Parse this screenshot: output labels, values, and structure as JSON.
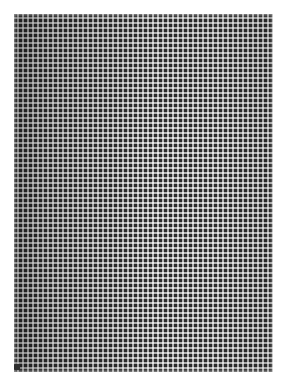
{
  "page": {
    "width": 287,
    "height": 386,
    "background_color": "#ffffff",
    "has_text": false,
    "has_ui_chrome": false
  },
  "pattern": {
    "name": "grid-mesh",
    "kind": "crosshatch-weave",
    "region": {
      "left": 14,
      "top": 14,
      "width": 259,
      "height": 358
    },
    "cell_pitch_px": 5,
    "thread_width_px": 3,
    "gap_width_px": 2,
    "columns": 52,
    "rows": 72,
    "colors": {
      "thread_dark": "#6b6b6b",
      "thread_mid": "#8f8f8f",
      "ground": "#9a9a9a",
      "intersection_highlight": "#ffffff",
      "page_background": "#ffffff"
    },
    "shading": {
      "direction": "left-dark-to-right-light",
      "left_overlay_color": "rgba(0,0,0,0.30)",
      "center_overlay_color": "rgba(0,0,0,0.04)",
      "right_overlay_color": "rgba(0,0,0,0.12)",
      "top_overlay_color": "rgba(0,0,0,0.06)",
      "bottom_overlay_color": "rgba(0,0,0,0.02)"
    }
  },
  "defect": {
    "name": "dark-cell",
    "label": "anomalous dark cell",
    "left": 14,
    "top": 364,
    "width": 6,
    "height": 6,
    "color": "#2e2e2e"
  }
}
